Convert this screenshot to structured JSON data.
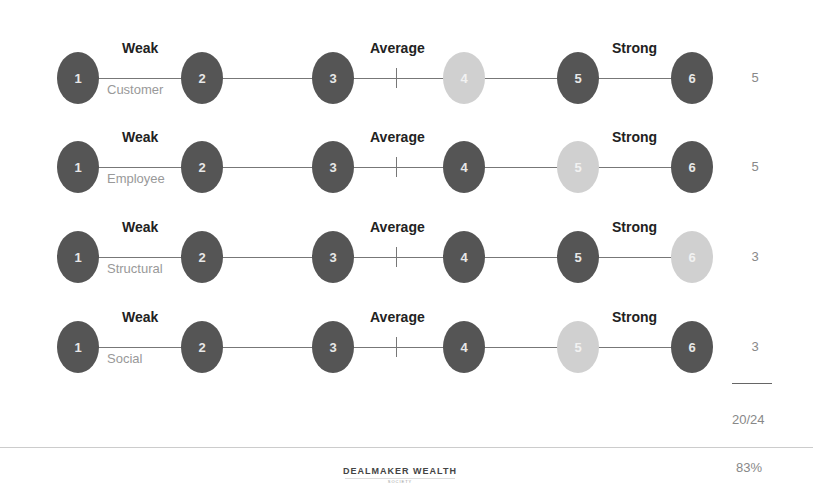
{
  "bands": {
    "weak": "Weak",
    "average": "Average",
    "strong": "Strong"
  },
  "rows": [
    {
      "category": "Customer",
      "selected": 4,
      "score": "5",
      "circles": [
        "1",
        "2",
        "3",
        "4",
        "5",
        "6"
      ]
    },
    {
      "category": "Employee",
      "selected": 5,
      "score": "5",
      "circles": [
        "1",
        "2",
        "3",
        "4",
        "5",
        "6"
      ]
    },
    {
      "category": "Structural",
      "selected": 6,
      "score": "3",
      "circles": [
        "1",
        "2",
        "3",
        "4",
        "5",
        "6"
      ]
    },
    {
      "category": "Social",
      "selected": 5,
      "score": "3",
      "circles": [
        "1",
        "2",
        "3",
        "4",
        "5",
        "6"
      ]
    }
  ],
  "summary": {
    "total": "20/24",
    "percent": "83%"
  },
  "footer": {
    "brand": "DEALMAKER WEALTH",
    "brand_sub": "SOCIETY"
  },
  "colors": {
    "unselected": "#555555",
    "selected": "#d0d0d0"
  }
}
